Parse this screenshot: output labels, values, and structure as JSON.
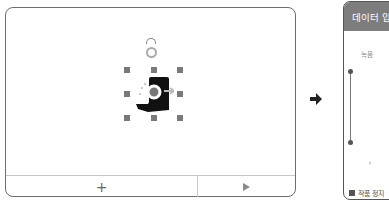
{
  "stage": {
    "add_button_label": "+",
    "play_button_icon": "play-icon",
    "selected_sprite": {
      "icon": "hand-holding-phone-icon",
      "handles": 8,
      "rotation_handle": true
    }
  },
  "transition_arrow_icon": "arrow-right-icon",
  "data_panel": {
    "title": "데이터 입",
    "section_label": "녹음",
    "stop_label": "작품 정지"
  },
  "colors": {
    "panel_header": "#7d7d7d",
    "handle": "#7a7a7a",
    "border": "#6e6e6e"
  }
}
